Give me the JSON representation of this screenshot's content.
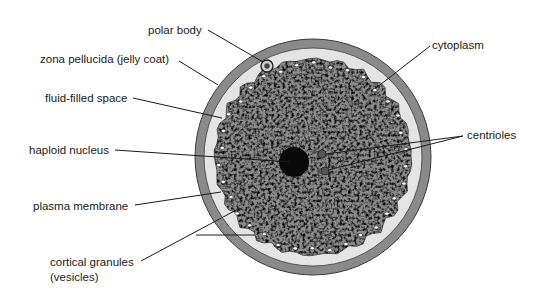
{
  "colors": {
    "background": "#ffffff",
    "zona_ring": "#8a8a8a",
    "zona_outline": "#3a3a3a",
    "fluid_space": "#e4e4e4",
    "cytoplasm_base": "#8c8c8c",
    "nucleus": "#0a0a0a",
    "centriole": "#555555",
    "leader_line": "#1a1a1a",
    "text": "#1a1a1a"
  },
  "geometry": {
    "cell_center": [
      313,
      157
    ],
    "zona_outer_radius": 118,
    "zona_inner_radius": 109,
    "cytoplasm_radius": 98,
    "nucleus": {
      "cx": 294,
      "cy": 162,
      "r": 15
    },
    "centrioles": [
      {
        "cx": 322,
        "cy": 154,
        "r": 4
      },
      {
        "cx": 325,
        "cy": 171,
        "r": 4
      }
    ],
    "polar_body": {
      "cx": 267,
      "cy": 66,
      "r": 6
    }
  },
  "labels": [
    {
      "id": "polar-body",
      "text": "polar body",
      "x": 148,
      "y": 23
    },
    {
      "id": "zona-pellucida",
      "text": "zona pellucida (jelly coat)",
      "x": 40,
      "y": 52
    },
    {
      "id": "fluid-filled-space",
      "text": "fluid-filled space",
      "x": 45,
      "y": 91
    },
    {
      "id": "haploid-nucleus",
      "text": "haploid nucleus",
      "x": 29,
      "y": 143
    },
    {
      "id": "plasma-membrane",
      "text": "plasma membrane",
      "x": 33,
      "y": 199
    },
    {
      "id": "cortical-granules",
      "text": "cortical granules",
      "x": 50,
      "y": 255
    },
    {
      "id": "cortical-granules-sub",
      "text": "(vesicles)",
      "x": 50,
      "y": 270
    },
    {
      "id": "cytoplasm",
      "text": "cytoplasm",
      "x": 432,
      "y": 38
    },
    {
      "id": "centrioles",
      "text": "centrioles",
      "x": 467,
      "y": 128
    }
  ],
  "leader_lines": [
    {
      "for": "polar-body",
      "x1": 208,
      "y1": 30,
      "x2": 263,
      "y2": 62
    },
    {
      "for": "zona-pellucida",
      "x1": 179,
      "y1": 61,
      "x2": 218,
      "y2": 85
    },
    {
      "for": "fluid-filled-space",
      "x1": 133,
      "y1": 98,
      "x2": 222,
      "y2": 118
    },
    {
      "for": "haploid-nucleus",
      "x1": 115,
      "y1": 150,
      "x2": 290,
      "y2": 162
    },
    {
      "for": "plasma-membrane",
      "x1": 135,
      "y1": 205,
      "x2": 221,
      "y2": 192
    },
    {
      "for": "cortical-granules",
      "x1": 141,
      "y1": 261,
      "x2": 240,
      "y2": 208
    },
    {
      "for": "unlabeled",
      "x1": 196,
      "y1": 235,
      "x2": 255,
      "y2": 235
    },
    {
      "for": "cytoplasm",
      "x1": 430,
      "y1": 46,
      "x2": 376,
      "y2": 88
    },
    {
      "for": "centrioles-1",
      "x1": 463,
      "y1": 136,
      "x2": 326,
      "y2": 154
    },
    {
      "for": "centrioles-2",
      "x1": 463,
      "y1": 136,
      "x2": 328,
      "y2": 170
    }
  ]
}
